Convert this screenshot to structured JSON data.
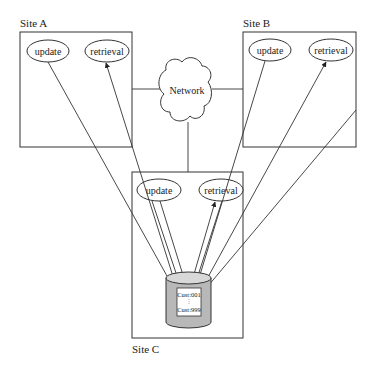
{
  "diagram": {
    "title": "",
    "sites": [
      {
        "id": "site-a",
        "label": "Site A",
        "processes": [
          "update",
          "retrieval"
        ]
      },
      {
        "id": "site-b",
        "label": "Site B",
        "processes": [
          "update",
          "retrieval"
        ]
      },
      {
        "id": "site-c",
        "label": "Site C",
        "processes": [
          "update",
          "retrieval"
        ]
      }
    ],
    "network": {
      "label": "Network"
    },
    "database": {
      "records": [
        "Cust:001",
        "Cust:999"
      ]
    },
    "colors": {
      "stroke": "#333333",
      "db_fill": "#b8b8b8",
      "background": "#ffffff"
    }
  }
}
